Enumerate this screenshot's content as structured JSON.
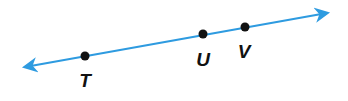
{
  "diagram": {
    "type": "line",
    "line_color": "#2e9be0",
    "point_color": "#111111",
    "line": {
      "x1": 25,
      "y1": 67,
      "x2": 327,
      "y2": 13
    },
    "points": [
      {
        "label": "T",
        "x": 85,
        "y": 56,
        "lx": 85,
        "ly": 87
      },
      {
        "label": "U",
        "x": 203,
        "y": 34,
        "lx": 203,
        "ly": 66
      },
      {
        "label": "V",
        "x": 245,
        "y": 27,
        "lx": 244,
        "ly": 58
      }
    ]
  }
}
